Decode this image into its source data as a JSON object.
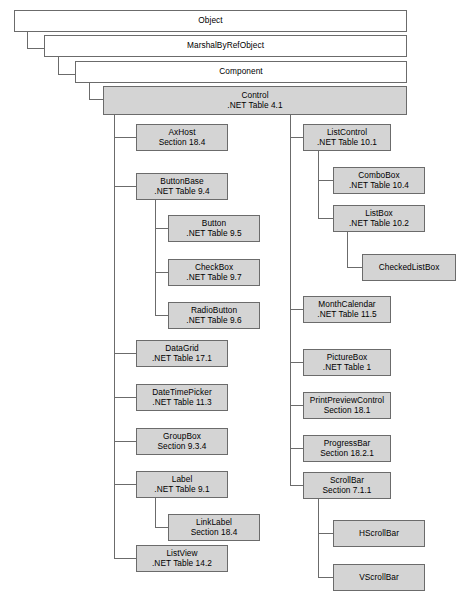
{
  "diagram": {
    "colors": {
      "shaded_fill": "#d4d4d4",
      "plain_fill": "#ffffff",
      "border": "#6b6b6b",
      "text": "#000000",
      "background": "#ffffff"
    },
    "nodes": {
      "object": {
        "name": "Object",
        "ref": ""
      },
      "marshalbyrefobject": {
        "name": "MarshalByRefObject",
        "ref": ""
      },
      "component": {
        "name": "Component",
        "ref": ""
      },
      "control": {
        "name": "Control",
        "ref": ".NET Table 4.1"
      },
      "axhost": {
        "name": "AxHost",
        "ref": "Section 18.4"
      },
      "buttonbase": {
        "name": "ButtonBase",
        "ref": ".NET Table 9.4"
      },
      "button": {
        "name": "Button",
        "ref": ".NET Table 9.5"
      },
      "checkbox": {
        "name": "CheckBox",
        "ref": ".NET Table 9.7"
      },
      "radiobutton": {
        "name": "RadioButton",
        "ref": ".NET Table 9.6"
      },
      "datagrid": {
        "name": "DataGrid",
        "ref": ".NET Table 17.1"
      },
      "datetimepicker": {
        "name": "DateTimePicker",
        "ref": ".NET Table 11.3"
      },
      "groupbox": {
        "name": "GroupBox",
        "ref": "Section 9.3.4"
      },
      "label": {
        "name": "Label",
        "ref": ".NET Table 9.1"
      },
      "linklabel": {
        "name": "LinkLabel",
        "ref": "Section 18.4"
      },
      "listview": {
        "name": "ListView",
        "ref": ".NET Table 14.2"
      },
      "listcontrol": {
        "name": "ListControl",
        "ref": ".NET Table 10.1"
      },
      "combobox": {
        "name": "ComboBox",
        "ref": ".NET Table 10.4"
      },
      "listbox": {
        "name": "ListBox",
        "ref": ".NET Table 10.2"
      },
      "checkedlistbox": {
        "name": "CheckedListBox",
        "ref": ""
      },
      "monthcalendar": {
        "name": "MonthCalendar",
        "ref": ".NET Table 11.5"
      },
      "picturebox": {
        "name": "PictureBox",
        "ref": ".NET Table 1"
      },
      "printpreviewcontrol": {
        "name": "PrintPreviewControl",
        "ref": "Section 18.1"
      },
      "progressbar": {
        "name": "ProgressBar",
        "ref": "Section 18.2.1"
      },
      "scrollbar": {
        "name": "ScrollBar",
        "ref": "Section 7.1.1"
      },
      "hscrollbar": {
        "name": "HScrollBar",
        "ref": ""
      },
      "vscrollbar": {
        "name": "VScrollBar",
        "ref": ""
      }
    }
  }
}
